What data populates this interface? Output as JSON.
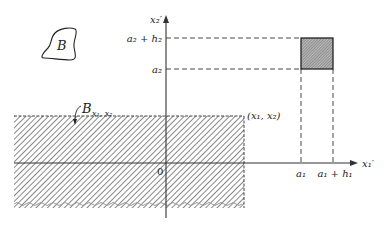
{
  "diagram": {
    "region_label": "B",
    "set_label": "B",
    "set_subscript": "x₁, x₂",
    "corner_label": "(x₁, x₂)",
    "origin_label": "0",
    "axes": {
      "horizontal": "x₁′",
      "vertical": "x₂′"
    },
    "ticks": {
      "horizontal": [
        "a₁",
        "a₁ + h₁"
      ],
      "vertical": [
        "a₂",
        "a₂ + h₂"
      ]
    },
    "colors": {
      "ink": "#222222",
      "hatch": "#555555",
      "square_fill": "#8a8a8a"
    }
  }
}
